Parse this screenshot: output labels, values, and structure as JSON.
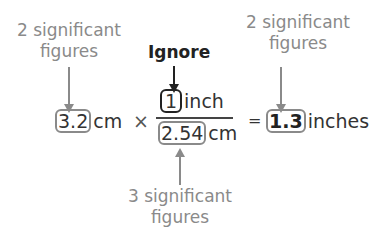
{
  "labels": {
    "left_top": [
      "2 significant",
      "figures"
    ],
    "ignore": "Ignore",
    "right_top": [
      "2 significant",
      "figures"
    ],
    "bottom": [
      "3 significant",
      "figures"
    ]
  },
  "equation": {
    "value1": "3.2",
    "unit1": "cm",
    "times": "×",
    "numerator_value": "1",
    "numerator_unit": "inch",
    "denominator_value": "2.54",
    "denominator_unit": "cm",
    "equals": "=",
    "result_value": "1.3",
    "result_unit": "inches"
  },
  "colors": {
    "annotation": "#8a8a8a",
    "ignore": "#222222"
  }
}
